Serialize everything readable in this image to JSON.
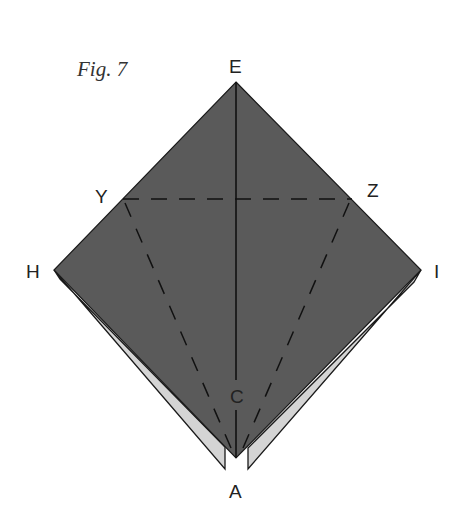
{
  "figure": {
    "title": "Fig. 7",
    "colors": {
      "paper_dark": "#5a5a5a",
      "paper_light": "#d4d4d4",
      "edge": "#1a1a1a",
      "crease": "#111111",
      "label": "#222222"
    },
    "points": {
      "E": {
        "label": "E",
        "x": 236,
        "y": 82
      },
      "H": {
        "label": "H",
        "x": 54,
        "y": 270
      },
      "I": {
        "label": "I",
        "x": 421,
        "y": 270
      },
      "A": {
        "label": "A",
        "x": 236,
        "y": 458
      },
      "Y": {
        "label": "Y",
        "x": 123,
        "y": 199
      },
      "Z": {
        "label": "Z",
        "x": 352,
        "y": 199
      },
      "C": {
        "label": "C",
        "x": 236,
        "y": 395
      }
    },
    "lines": {
      "valley_folds": [
        "Y-Z",
        "Y-A",
        "Z-A"
      ],
      "creases": [
        "E-A"
      ]
    }
  }
}
